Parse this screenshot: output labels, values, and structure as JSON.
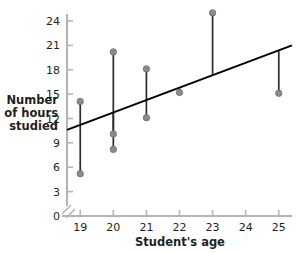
{
  "chart_data": {
    "type": "scatter",
    "title": "",
    "subtitle": "",
    "xlabel": "Student's age",
    "ylabel": "Number of hours studied",
    "ylabel_lines": [
      "Number",
      "of hours",
      "studied"
    ],
    "xlim": [
      18.6,
      25.4
    ],
    "ylim": [
      0,
      25.6
    ],
    "xticks": [
      19,
      20,
      21,
      22,
      23,
      24,
      25
    ],
    "xtick_labels": [
      "19",
      "20",
      "21",
      "22",
      "23",
      "24",
      "25"
    ],
    "yticks": [
      0,
      3,
      6,
      9,
      12,
      15,
      18,
      21,
      24
    ],
    "ytick_labels": [
      "0",
      "3",
      "6",
      "9",
      "12",
      "15",
      "18",
      "21",
      "24"
    ],
    "grid": false,
    "legend": null,
    "axis_break": true,
    "points": [
      {
        "x": 19,
        "y": 14.1
      },
      {
        "x": 19,
        "y": 5.2
      },
      {
        "x": 20,
        "y": 20.2
      },
      {
        "x": 20,
        "y": 10.1
      },
      {
        "x": 20,
        "y": 8.2
      },
      {
        "x": 21,
        "y": 18.1
      },
      {
        "x": 21,
        "y": 12.1
      },
      {
        "x": 22,
        "y": 15.2
      },
      {
        "x": 23,
        "y": 25.0
      },
      {
        "x": 25,
        "y": 15.1
      }
    ],
    "residual_segments": [
      {
        "x": 19,
        "y_point": 14.1,
        "y_fit": 11.2
      },
      {
        "x": 19,
        "y_point": 5.2,
        "y_fit": 11.2
      },
      {
        "x": 20,
        "y_point": 20.2,
        "y_fit": 12.7
      },
      {
        "x": 20,
        "y_point": 10.1,
        "y_fit": 12.7
      },
      {
        "x": 20,
        "y_point": 8.2,
        "y_fit": 12.7
      },
      {
        "x": 21,
        "y_point": 18.1,
        "y_fit": 14.2
      },
      {
        "x": 21,
        "y_point": 12.1,
        "y_fit": 14.2
      },
      {
        "x": 22,
        "y_point": 15.2,
        "y_fit": 15.7
      },
      {
        "x": 23,
        "y_point": 25.0,
        "y_fit": 17.3
      },
      {
        "x": 25,
        "y_point": 15.1,
        "y_fit": 20.3
      }
    ],
    "trendline": {
      "name": "least-squares regression line",
      "x_start": 18.6,
      "y_start": 10.6,
      "x_end": 25.4,
      "y_end": 21.0,
      "slope": 1.53,
      "intercept": -17.8
    },
    "colors": {
      "point_fill": "#8a8a8a",
      "point_stroke": "#6e6e6e",
      "residual_line": "#2b2b2b",
      "trendline": "#000000",
      "axis": "#b5b5b5",
      "tick": "#b5b5b5",
      "text": "#231f20",
      "background": "#ffffff"
    }
  }
}
